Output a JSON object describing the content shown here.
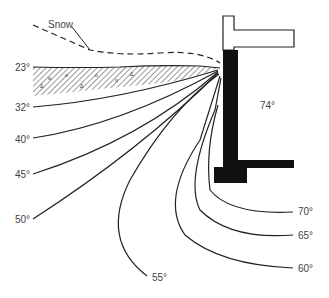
{
  "diagram": {
    "title": "",
    "snow_label": "Snow",
    "interior_temp": "74°",
    "isotherms": [
      {
        "id": "23",
        "label": "23°"
      },
      {
        "id": "32",
        "label": "32°"
      },
      {
        "id": "40",
        "label": "40°"
      },
      {
        "id": "45",
        "label": "45°"
      },
      {
        "id": "50",
        "label": "50°"
      },
      {
        "id": "55",
        "label": "55°"
      },
      {
        "id": "60",
        "label": "60°"
      },
      {
        "id": "65",
        "label": "65°"
      },
      {
        "id": "70",
        "label": "70°"
      }
    ],
    "colors": {
      "line": "#222222",
      "wall": "#111111",
      "label": "#444444",
      "background": "#ffffff"
    }
  }
}
